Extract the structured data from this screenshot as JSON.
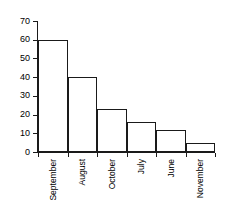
{
  "chart_data": {
    "type": "bar",
    "title": "",
    "subtitle": "",
    "xlabel": "",
    "ylabel": "",
    "categories": [
      "September",
      "August",
      "October",
      "July",
      "June",
      "November"
    ],
    "values": [
      60,
      40,
      23,
      16,
      12,
      5
    ],
    "series": [
      {
        "name": "",
        "values": [
          60,
          40,
          23,
          16,
          12,
          5
        ]
      }
    ],
    "ylim": [
      0,
      70
    ],
    "ytick_values": [
      0,
      10,
      20,
      30,
      40,
      50,
      60,
      70
    ],
    "ytick_labels": [
      "0",
      "10",
      "20",
      "30",
      "40",
      "50",
      "60",
      "70"
    ],
    "grid": false,
    "legend": false,
    "legend_position": "none",
    "orientation": "vertical",
    "bar_gap": 0,
    "annotations": [],
    "colors": {
      "bar_fill": "#ffffff",
      "bar_outline": "#1a1a1a",
      "axis": "#1a1a1a",
      "text": "#000000",
      "background": "#ffffff"
    }
  }
}
